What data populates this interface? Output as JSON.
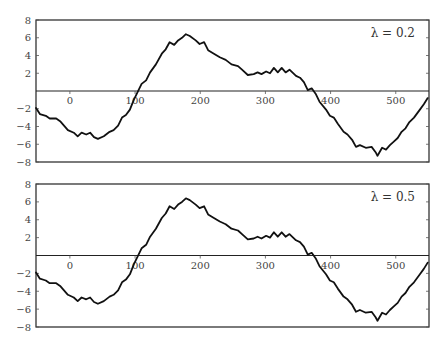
{
  "chart_data": [
    {
      "type": "line",
      "title": "",
      "annotation": "λ = 0.2",
      "xlabel": "",
      "ylabel": "",
      "xlim": [
        -52,
        551
      ],
      "ylim": [
        -8,
        8
      ],
      "xticks": [
        0,
        100,
        200,
        300,
        400,
        500
      ],
      "xtick_labels": [
        "0",
        "100",
        "200",
        "300",
        "400",
        "500"
      ],
      "yticks": [
        8,
        6,
        4,
        2,
        -2,
        -4,
        -6,
        -8
      ],
      "ytick_labels": [
        "8",
        "6",
        "4",
        "2",
        "−2",
        "−4",
        "−6",
        "−8"
      ],
      "grid": false,
      "zero_line": true,
      "series": [
        {
          "name": "signal",
          "x": [
            -52,
            -46,
            -37,
            -31,
            -21,
            -15,
            -9,
            -3,
            6,
            12,
            18,
            25,
            31,
            37,
            43,
            52,
            61,
            67,
            74,
            80,
            86,
            92,
            98,
            104,
            110,
            117,
            123,
            132,
            141,
            147,
            153,
            160,
            166,
            172,
            178,
            184,
            193,
            199,
            206,
            212,
            221,
            230,
            239,
            248,
            258,
            264,
            273,
            282,
            288,
            294,
            301,
            307,
            313,
            319,
            325,
            331,
            337,
            347,
            353,
            359,
            365,
            371,
            377,
            383,
            393,
            399,
            405,
            411,
            420,
            426,
            433,
            439,
            445,
            454,
            463,
            469,
            472,
            479,
            485,
            491,
            497,
            503,
            509,
            515,
            521,
            528,
            537,
            543,
            549
          ],
          "y": [
            -1.9,
            -2.6,
            -2.8,
            -3.1,
            -3.1,
            -3.4,
            -3.9,
            -4.4,
            -4.7,
            -5.1,
            -4.7,
            -4.9,
            -4.7,
            -5.2,
            -5.4,
            -5.1,
            -4.6,
            -4.4,
            -3.9,
            -3.0,
            -2.7,
            -2.1,
            -1.0,
            -0.1,
            0.8,
            1.2,
            2.1,
            3.0,
            4.2,
            4.7,
            5.5,
            5.2,
            5.7,
            6.0,
            6.4,
            6.2,
            5.7,
            5.3,
            5.5,
            4.6,
            4.2,
            3.8,
            3.5,
            3.0,
            2.8,
            2.4,
            1.8,
            1.9,
            2.1,
            1.9,
            2.2,
            2.0,
            2.6,
            2.1,
            2.6,
            2.1,
            2.4,
            1.7,
            1.5,
            1.0,
            0.1,
            0.3,
            -0.3,
            -1.2,
            -2.1,
            -2.8,
            -3.0,
            -3.7,
            -4.6,
            -4.9,
            -5.5,
            -6.3,
            -6.1,
            -6.4,
            -6.3,
            -6.9,
            -7.3,
            -6.4,
            -6.6,
            -6.1,
            -5.7,
            -5.3,
            -4.6,
            -4.2,
            -3.5,
            -3.0,
            -2.1,
            -1.5,
            -0.8
          ]
        }
      ]
    },
    {
      "type": "line",
      "title": "",
      "annotation": "λ = 0.5",
      "xlabel": "",
      "ylabel": "",
      "xlim": [
        -52,
        551
      ],
      "ylim": [
        -8,
        8
      ],
      "xticks": [
        0,
        100,
        200,
        300,
        400,
        500
      ],
      "xtick_labels": [
        "0",
        "100",
        "200",
        "300",
        "400",
        "500"
      ],
      "yticks": [
        8,
        6,
        4,
        2,
        -2,
        -4,
        -6,
        -8
      ],
      "ytick_labels": [
        "8",
        "6",
        "4",
        "2",
        "−2",
        "−4",
        "−6",
        "−8"
      ],
      "grid": false,
      "zero_line": true,
      "series": [
        {
          "name": "signal",
          "x": [
            -52,
            -46,
            -37,
            -31,
            -21,
            -15,
            -9,
            -3,
            6,
            12,
            18,
            25,
            31,
            37,
            43,
            52,
            61,
            67,
            74,
            80,
            86,
            92,
            98,
            104,
            110,
            117,
            123,
            132,
            141,
            147,
            153,
            160,
            166,
            172,
            178,
            184,
            193,
            199,
            206,
            212,
            221,
            230,
            239,
            248,
            258,
            264,
            273,
            282,
            288,
            294,
            301,
            307,
            313,
            319,
            325,
            331,
            337,
            347,
            353,
            359,
            365,
            371,
            377,
            383,
            393,
            399,
            405,
            411,
            420,
            426,
            433,
            439,
            445,
            454,
            463,
            469,
            472,
            479,
            485,
            491,
            497,
            503,
            509,
            515,
            521,
            528,
            537,
            543,
            549
          ],
          "y": [
            -1.9,
            -2.6,
            -2.8,
            -3.1,
            -3.1,
            -3.4,
            -3.9,
            -4.4,
            -4.7,
            -5.1,
            -4.7,
            -4.9,
            -4.7,
            -5.2,
            -5.4,
            -5.1,
            -4.6,
            -4.4,
            -3.9,
            -3.0,
            -2.7,
            -2.1,
            -1.0,
            -0.1,
            0.8,
            1.2,
            2.1,
            3.0,
            4.2,
            4.7,
            5.5,
            5.2,
            5.7,
            6.0,
            6.4,
            6.2,
            5.7,
            5.3,
            5.5,
            4.6,
            4.2,
            3.8,
            3.5,
            3.0,
            2.8,
            2.4,
            1.8,
            1.9,
            2.1,
            1.9,
            2.2,
            2.0,
            2.6,
            2.1,
            2.6,
            2.1,
            2.4,
            1.7,
            1.5,
            1.0,
            0.1,
            0.3,
            -0.3,
            -1.2,
            -2.1,
            -2.8,
            -3.0,
            -3.7,
            -4.6,
            -4.9,
            -5.5,
            -6.3,
            -6.1,
            -6.4,
            -6.3,
            -6.9,
            -7.3,
            -6.4,
            -6.6,
            -6.1,
            -5.7,
            -5.3,
            -4.6,
            -4.2,
            -3.5,
            -3.0,
            -2.1,
            -1.5,
            -0.8
          ]
        }
      ]
    }
  ]
}
